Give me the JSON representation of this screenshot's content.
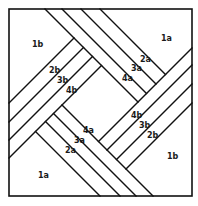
{
  "diagram": {
    "type": "quilt-block-piecing-diagram",
    "border": {
      "x": 9,
      "y": 9,
      "width": 183,
      "height": 187
    },
    "colors": {
      "line": "#111111",
      "background": "#ffffff",
      "text": "#1a1a1a"
    },
    "labels": [
      {
        "id": "1b-top-left",
        "text": "1b",
        "x": 32,
        "y": 47
      },
      {
        "id": "2b-left",
        "text": "2b",
        "x": 49,
        "y": 73
      },
      {
        "id": "3b-left",
        "text": "3b",
        "x": 57,
        "y": 83
      },
      {
        "id": "4b-left",
        "text": "4b",
        "x": 66,
        "y": 93
      },
      {
        "id": "1a-top-right",
        "text": "1a",
        "x": 161,
        "y": 41
      },
      {
        "id": "2a-top",
        "text": "2a",
        "x": 140,
        "y": 62
      },
      {
        "id": "3a-top",
        "text": "3a",
        "x": 131,
        "y": 71
      },
      {
        "id": "4a-top",
        "text": "4a",
        "x": 122,
        "y": 81
      },
      {
        "id": "4a-bottom",
        "text": "4a",
        "x": 83,
        "y": 133
      },
      {
        "id": "3a-bottom",
        "text": "3a",
        "x": 74,
        "y": 143
      },
      {
        "id": "2a-bottom",
        "text": "2a",
        "x": 65,
        "y": 153
      },
      {
        "id": "1a-bottom-left",
        "text": "1a",
        "x": 38,
        "y": 178
      },
      {
        "id": "4b-right",
        "text": "4b",
        "x": 131,
        "y": 118
      },
      {
        "id": "3b-right",
        "text": "3b",
        "x": 139,
        "y": 128
      },
      {
        "id": "2b-right",
        "text": "2b",
        "x": 147,
        "y": 138
      },
      {
        "id": "1b-bottom-right",
        "text": "1b",
        "x": 167,
        "y": 159
      }
    ],
    "lines": [
      {
        "band": "top-a",
        "x1": 45,
        "y1": 9,
        "x2": 138,
        "y2": 102
      },
      {
        "band": "top-a",
        "x1": 62,
        "y1": 9,
        "x2": 146.5,
        "y2": 93.5
      },
      {
        "band": "top-a",
        "x1": 81,
        "y1": 9,
        "x2": 156,
        "y2": 84
      },
      {
        "band": "top-a",
        "x1": 100,
        "y1": 9,
        "x2": 165.5,
        "y2": 74.5
      },
      {
        "band": "left-b",
        "x1": 9,
        "y1": 103,
        "x2": 74,
        "y2": 38
      },
      {
        "band": "left-b",
        "x1": 9,
        "y1": 122,
        "x2": 83.5,
        "y2": 47.5
      },
      {
        "band": "left-b",
        "x1": 9,
        "y1": 140,
        "x2": 92.5,
        "y2": 56.5
      },
      {
        "band": "left-b",
        "x1": 9,
        "y1": 158,
        "x2": 101.5,
        "y2": 65.5
      },
      {
        "band": "bottom-a",
        "x1": 35.5,
        "y1": 131.5,
        "x2": 100,
        "y2": 196
      },
      {
        "band": "bottom-a",
        "x1": 45.5,
        "y1": 121.5,
        "x2": 120,
        "y2": 196
      },
      {
        "band": "bottom-a",
        "x1": 53.5,
        "y1": 113.5,
        "x2": 136,
        "y2": 196
      },
      {
        "band": "bottom-a",
        "x1": 62,
        "y1": 105,
        "x2": 153,
        "y2": 196
      },
      {
        "band": "right-b",
        "x1": 98.5,
        "y1": 141.5,
        "x2": 192,
        "y2": 48
      },
      {
        "band": "right-b",
        "x1": 107,
        "y1": 150,
        "x2": 192,
        "y2": 65
      },
      {
        "band": "right-b",
        "x1": 116.5,
        "y1": 159.5,
        "x2": 192,
        "y2": 84
      },
      {
        "band": "right-b",
        "x1": 126,
        "y1": 169,
        "x2": 192,
        "y2": 103
      }
    ]
  }
}
